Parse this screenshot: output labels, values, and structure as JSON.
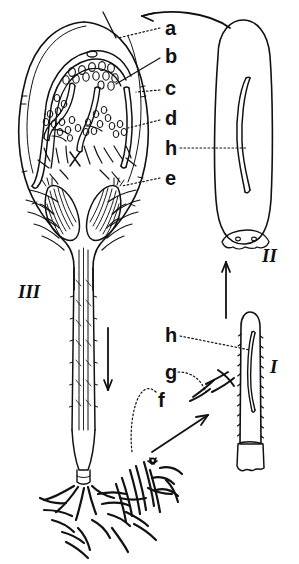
{
  "figure": {
    "ink_color": "#111111",
    "background_color": "#ffffff",
    "part_labels": [
      {
        "key": "a",
        "text": "a",
        "x": 165,
        "y": 28
      },
      {
        "key": "b",
        "text": "b",
        "x": 165,
        "y": 56
      },
      {
        "key": "c",
        "text": "c",
        "x": 165,
        "y": 88
      },
      {
        "key": "d",
        "text": "d",
        "x": 165,
        "y": 118
      },
      {
        "key": "h_top",
        "text": "h",
        "x": 165,
        "y": 148
      },
      {
        "key": "e",
        "text": "e",
        "x": 165,
        "y": 178
      },
      {
        "key": "h_bottom",
        "text": "h",
        "x": 165,
        "y": 333
      },
      {
        "key": "g",
        "text": "g",
        "x": 165,
        "y": 370
      },
      {
        "key": "f",
        "text": "f",
        "x": 158,
        "y": 398
      }
    ],
    "stage_labels": [
      {
        "key": "III",
        "text": "III",
        "x": 18,
        "y": 292
      },
      {
        "key": "II",
        "text": "II",
        "x": 262,
        "y": 256
      },
      {
        "key": "I",
        "text": "I",
        "x": 268,
        "y": 367
      }
    ],
    "arrows": [
      {
        "name": "stage-two-to-three-arrow",
        "direction": "left",
        "from": "II",
        "to": "III"
      },
      {
        "name": "stage-one-to-two-arrow",
        "direction": "up",
        "from": "I",
        "to": "II"
      },
      {
        "name": "germination-arrow",
        "direction": "up-right",
        "from": "seedling-base",
        "to": "I"
      },
      {
        "name": "stage-three-down-arrow",
        "direction": "down",
        "from": "III",
        "to": "root-zone"
      }
    ],
    "structures": [
      {
        "name": "ovary-longitudinal-section",
        "stage": "III"
      },
      {
        "name": "mature-seed",
        "stage": "II"
      },
      {
        "name": "elongated-fruit",
        "stage": "I"
      },
      {
        "name": "root-hair-mass",
        "stage": "base"
      }
    ]
  }
}
